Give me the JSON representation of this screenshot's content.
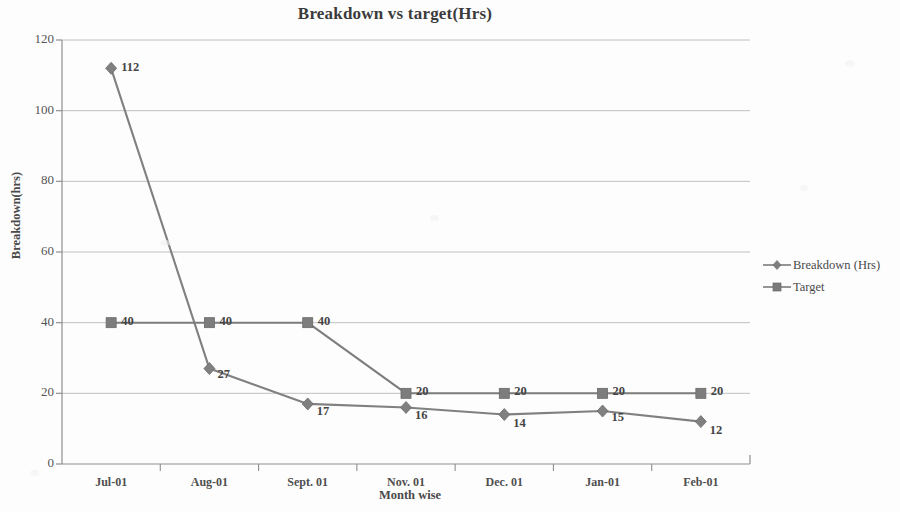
{
  "chart_data": {
    "type": "line",
    "title": "Breakdown vs target(Hrs)",
    "xlabel": "Month  wise",
    "ylabel": "Breakdown(hrs)",
    "categories": [
      "Jul-01",
      "Aug-01",
      "Sept. 01",
      "Nov. 01",
      "Dec. 01",
      "Jan-01",
      "Feb-01"
    ],
    "ylim": [
      0,
      120
    ],
    "yticks": [
      0,
      20,
      40,
      60,
      80,
      100,
      120
    ],
    "grid": true,
    "legend_position": "right",
    "series": [
      {
        "name": "Breakdown (Hrs)",
        "marker": "diamond",
        "color": "#808080",
        "values": [
          112,
          27,
          17,
          16,
          14,
          15,
          12
        ],
        "labels": [
          "112",
          "27",
          "17",
          "16",
          "14",
          "15",
          "12"
        ]
      },
      {
        "name": "Target",
        "marker": "square",
        "color": "#7d7d7d",
        "values": [
          40,
          40,
          40,
          20,
          20,
          20,
          20
        ],
        "labels": [
          "40",
          "40",
          "40",
          "20",
          "20",
          "20",
          "20"
        ]
      }
    ]
  },
  "axis": {
    "y_tick_labels": [
      "120",
      "100",
      "80",
      "60",
      "40",
      "20",
      "0"
    ]
  }
}
